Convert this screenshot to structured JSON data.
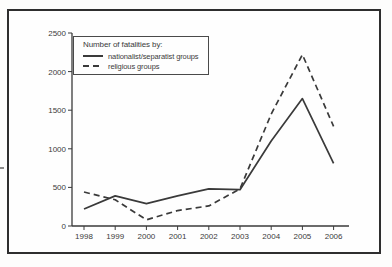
{
  "chart_data": {
    "type": "line",
    "title": "",
    "xlabel": "",
    "ylabel": "",
    "legend_title": "Number of fatalities by:",
    "legend_position": "top-left",
    "grid": false,
    "x": [
      "1998",
      "1999",
      "2000",
      "2001",
      "2002",
      "2003",
      "2004",
      "2005",
      "2006"
    ],
    "series": [
      {
        "name": "nationalist/separatist groups",
        "line_style": "solid",
        "values": [
          220,
          390,
          290,
          390,
          480,
          470,
          1100,
          1650,
          810
        ]
      },
      {
        "name": "religious groups",
        "line_style": "dashed",
        "values": [
          440,
          340,
          80,
          200,
          260,
          480,
          1450,
          2220,
          1290
        ]
      }
    ],
    "ylim": [
      0,
      2500
    ],
    "yticks": [
      0,
      500,
      1000,
      1500,
      2000,
      2500
    ],
    "line_color": "#3a3a3a",
    "axis_color": "#3a3a3a",
    "text_color": "#3b3b3b"
  }
}
